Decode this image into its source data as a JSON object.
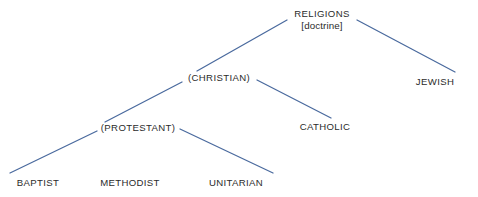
{
  "diagram": {
    "type": "hierarchy-tree",
    "title": "",
    "canvas": {
      "width": 478,
      "height": 197
    },
    "colors": {
      "background": "#ffffff",
      "line": "#4a6a9e",
      "text": "#2b2b2b"
    },
    "nodes": [
      {
        "id": "religions",
        "label": "RELIGIONS",
        "subtitle": "[doctrine]",
        "level": 0,
        "x": 322,
        "y": 20,
        "half_width": 32
      },
      {
        "id": "christian",
        "label": "(CHRISTIAN)",
        "subtitle": "",
        "level": 1,
        "x": 219,
        "y": 78,
        "half_width": 34
      },
      {
        "id": "jewish",
        "label": "JEWISH",
        "subtitle": "",
        "level": 1,
        "x": 435,
        "y": 82,
        "half_width": 22
      },
      {
        "id": "protestant",
        "label": "(PROTESTANT)",
        "subtitle": "",
        "level": 2,
        "x": 138,
        "y": 128,
        "half_width": 40
      },
      {
        "id": "catholic",
        "label": "CATHOLIC",
        "subtitle": "",
        "level": 2,
        "x": 325,
        "y": 127,
        "half_width": 26
      },
      {
        "id": "baptist",
        "label": "BAPTIST",
        "subtitle": "",
        "level": 3,
        "x": 38,
        "y": 183,
        "half_width": 23
      },
      {
        "id": "methodist",
        "label": "METHODIST",
        "subtitle": "",
        "level": 3,
        "x": 130,
        "y": 183,
        "half_width": 33
      },
      {
        "id": "unitarian",
        "label": "UNITARIAN",
        "subtitle": "",
        "level": 3,
        "x": 236,
        "y": 183,
        "half_width": 31
      }
    ],
    "edges": [
      {
        "id": "religions-christian",
        "from": "religions",
        "to": "christian",
        "x1": 287,
        "y1": 20,
        "x2": 197,
        "y2": 71
      },
      {
        "id": "religions-jewish",
        "from": "religions",
        "to": "jewish",
        "x1": 357,
        "y1": 20,
        "x2": 455,
        "y2": 72
      },
      {
        "id": "christian-protestant",
        "from": "christian",
        "to": "protestant",
        "x1": 182,
        "y1": 82,
        "x2": 105,
        "y2": 122
      },
      {
        "id": "christian-catholic",
        "from": "christian",
        "to": "catholic",
        "x1": 257,
        "y1": 80,
        "x2": 331,
        "y2": 118
      },
      {
        "id": "protestant-baptist",
        "from": "protestant",
        "to": "baptist",
        "x1": 97,
        "y1": 131,
        "x2": 10,
        "y2": 173
      },
      {
        "id": "protestant-methodist",
        "from": "protestant",
        "to": "methodist",
        "x1": 138,
        "y1": 136,
        "x2": 138,
        "y2": 136
      },
      {
        "id": "protestant-unitarian",
        "from": "protestant",
        "to": "unitarian",
        "x1": 180,
        "y1": 129,
        "x2": 273,
        "y2": 173
      }
    ]
  }
}
